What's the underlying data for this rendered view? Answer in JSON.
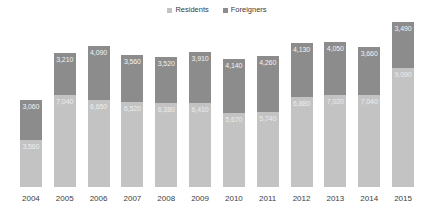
{
  "chart_data": {
    "type": "bar",
    "subtype": "stacked-column",
    "title": "",
    "xlabel": "",
    "ylabel": "",
    "grid": false,
    "legend_position": "top-center",
    "categories": [
      "2004",
      "2005",
      "2006",
      "2007",
      "2008",
      "2009",
      "2010",
      "2011",
      "2012",
      "2013",
      "2014",
      "2015"
    ],
    "series": [
      {
        "name": "Residents",
        "color": "#c3c3c3",
        "values": [
          3560,
          7040,
          6650,
          6520,
          6380,
          6410,
          5670,
          5740,
          6880,
          7020,
          7040,
          9090
        ],
        "value_labels": [
          "3,560",
          "7,040",
          "6,650",
          "6,520",
          "6,380",
          "6,410",
          "5,670",
          "5,740",
          "6,880",
          "7,020",
          "7,040",
          "9,090"
        ]
      },
      {
        "name": "Foreigners",
        "color": "#8c8c8c",
        "values": [
          3060,
          3210,
          4090,
          3560,
          3520,
          3910,
          4140,
          4260,
          4130,
          4050,
          3660,
          3490
        ],
        "value_labels": [
          "3,060",
          "3,210",
          "4,090",
          "3,560",
          "3,520",
          "3,910",
          "4,140",
          "4,260",
          "4,130",
          "4,050",
          "3,660",
          "3,490"
        ]
      }
    ],
    "ylim": [
      0,
      12600
    ]
  },
  "legend": {
    "items": [
      {
        "label": "Residents",
        "color": "#c3c3c3",
        "marker": "square-swatch-icon"
      },
      {
        "label": "Foreigners",
        "color": "#8c8c8c",
        "marker": "square-swatch-icon"
      }
    ]
  }
}
